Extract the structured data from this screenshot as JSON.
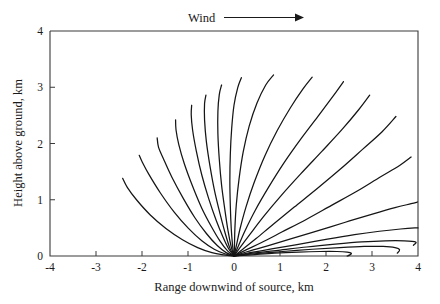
{
  "figure": {
    "background_color": "#ffffff",
    "curve_color": "#151515",
    "axis_color": "#3a3a3a"
  },
  "annotations": {
    "wind_label": "Wind",
    "wind_arrow_icon": "arrow-right-icon"
  },
  "axes": {
    "x_title": "Range downwind of source, km",
    "y_title": "Height above ground, km",
    "x_ticks": [
      "-4",
      "-3",
      "-2",
      "-1",
      "0",
      "1",
      "2",
      "3",
      "4"
    ],
    "y_ticks": [
      "0",
      "1",
      "2",
      "3",
      "4"
    ]
  },
  "chart_data": {
    "type": "line",
    "title": "",
    "xlabel": "Range downwind of source, km",
    "ylabel": "Height above ground, km",
    "xlim": [
      -4,
      4
    ],
    "ylim": [
      0,
      4
    ],
    "xticks": [
      -4,
      -3,
      -2,
      -1,
      0,
      1,
      2,
      3,
      4
    ],
    "yticks": [
      0,
      1,
      2,
      3,
      4
    ],
    "grid": false,
    "legend": null,
    "annotations": [
      {
        "text": "Wind",
        "position": "above-axes",
        "arrow": "points-right"
      }
    ],
    "series": [
      {
        "name": "trajectory-1",
        "x": [
          0,
          -0.22,
          -0.48,
          -0.79,
          -1.12,
          -1.48,
          -1.82,
          -2.12,
          -2.32,
          -2.42
        ],
        "y": [
          0,
          0.02,
          0.06,
          0.15,
          0.29,
          0.49,
          0.73,
          1.0,
          1.22,
          1.38
        ]
      },
      {
        "name": "trajectory-2",
        "x": [
          0,
          -0.2,
          -0.43,
          -0.7,
          -0.99,
          -1.3,
          -1.6,
          -1.85,
          -2.0,
          -2.06
        ],
        "y": [
          0,
          0.04,
          0.12,
          0.27,
          0.49,
          0.78,
          1.12,
          1.45,
          1.68,
          1.79
        ]
      },
      {
        "name": "trajectory-3",
        "x": [
          0,
          -0.17,
          -0.37,
          -0.6,
          -0.85,
          -1.1,
          -1.35,
          -1.53,
          -1.64,
          -1.67
        ],
        "y": [
          0,
          0.06,
          0.19,
          0.4,
          0.68,
          1.02,
          1.4,
          1.72,
          1.93,
          2.1
        ]
      },
      {
        "name": "trajectory-4",
        "x": [
          0,
          -0.14,
          -0.3,
          -0.49,
          -0.7,
          -0.9,
          -1.08,
          -1.2,
          -1.26,
          -1.27
        ],
        "y": [
          0,
          0.09,
          0.26,
          0.52,
          0.85,
          1.24,
          1.64,
          1.98,
          2.24,
          2.42
        ]
      },
      {
        "name": "trajectory-5",
        "x": [
          0,
          -0.11,
          -0.24,
          -0.39,
          -0.55,
          -0.7,
          -0.82,
          -0.9,
          -0.93,
          -0.92
        ],
        "y": [
          0,
          0.12,
          0.34,
          0.64,
          1.02,
          1.44,
          1.87,
          2.24,
          2.51,
          2.68
        ]
      },
      {
        "name": "trajectory-6",
        "x": [
          0,
          -0.09,
          -0.19,
          -0.3,
          -0.42,
          -0.52,
          -0.6,
          -0.64,
          -0.64,
          -0.61
        ],
        "y": [
          0,
          0.14,
          0.4,
          0.74,
          1.15,
          1.59,
          2.03,
          2.42,
          2.71,
          2.86
        ]
      },
      {
        "name": "trajectory-7",
        "x": [
          0,
          -0.06,
          -0.13,
          -0.2,
          -0.27,
          -0.32,
          -0.35,
          -0.35,
          -0.32,
          -0.27
        ],
        "y": [
          0,
          0.16,
          0.45,
          0.83,
          1.26,
          1.72,
          2.17,
          2.57,
          2.87,
          3.04
        ]
      },
      {
        "name": "trajectory-8",
        "x": [
          0,
          -0.03,
          -0.06,
          -0.08,
          -0.09,
          -0.08,
          -0.05,
          0.0,
          0.08,
          0.16
        ],
        "y": [
          0,
          0.18,
          0.49,
          0.89,
          1.34,
          1.81,
          2.27,
          2.68,
          2.99,
          3.17
        ]
      },
      {
        "name": "trajectory-9",
        "x": [
          0,
          0.01,
          0.02,
          0.05,
          0.11,
          0.2,
          0.33,
          0.5,
          0.69,
          0.86
        ],
        "y": [
          0,
          0.18,
          0.5,
          0.91,
          1.37,
          1.85,
          2.31,
          2.72,
          3.04,
          3.22
        ]
      },
      {
        "name": "trajectory-10",
        "x": [
          0,
          0.05,
          0.13,
          0.26,
          0.44,
          0.67,
          0.94,
          1.23,
          1.5,
          1.7
        ],
        "y": [
          0,
          0.18,
          0.48,
          0.87,
          1.31,
          1.78,
          2.23,
          2.64,
          2.97,
          3.18
        ]
      },
      {
        "name": "trajectory-11",
        "x": [
          0,
          0.09,
          0.24,
          0.46,
          0.75,
          1.09,
          1.47,
          1.85,
          2.17,
          2.38
        ],
        "y": [
          0,
          0.17,
          0.45,
          0.81,
          1.22,
          1.66,
          2.1,
          2.51,
          2.86,
          3.1
        ]
      },
      {
        "name": "trajectory-12",
        "x": [
          0,
          0.13,
          0.35,
          0.65,
          1.02,
          1.45,
          1.91,
          2.35,
          2.71,
          2.95
        ],
        "y": [
          0,
          0.15,
          0.39,
          0.71,
          1.07,
          1.46,
          1.86,
          2.25,
          2.6,
          2.86
        ]
      },
      {
        "name": "trajectory-13",
        "x": [
          0,
          0.19,
          0.48,
          0.86,
          1.31,
          1.81,
          2.32,
          2.8,
          3.22,
          3.52
        ],
        "y": [
          0,
          0.12,
          0.31,
          0.57,
          0.87,
          1.2,
          1.55,
          1.9,
          2.21,
          2.48
        ]
      },
      {
        "name": "trajectory-14",
        "x": [
          0,
          0.24,
          0.6,
          1.05,
          1.57,
          2.12,
          2.67,
          3.17,
          3.6,
          3.85
        ],
        "y": [
          0,
          0.1,
          0.24,
          0.43,
          0.65,
          0.9,
          1.15,
          1.4,
          1.61,
          1.76
        ]
      },
      {
        "name": "trajectory-15",
        "x": [
          0,
          0.3,
          0.73,
          1.25,
          1.83,
          2.42,
          2.99,
          3.5,
          3.85,
          3.99
        ],
        "y": [
          0,
          0.08,
          0.18,
          0.31,
          0.45,
          0.6,
          0.74,
          0.86,
          0.93,
          0.96
        ]
      },
      {
        "name": "trajectory-16",
        "x": [
          0,
          0.35,
          0.85,
          1.43,
          2.03,
          2.62,
          3.16,
          3.62,
          3.93,
          4.0
        ],
        "y": [
          0,
          0.06,
          0.13,
          0.21,
          0.3,
          0.38,
          0.44,
          0.48,
          0.5,
          0.5
        ]
      },
      {
        "name": "trajectory-17",
        "x": [
          0,
          0.4,
          0.96,
          1.58,
          2.2,
          2.78,
          3.29,
          3.7,
          3.95,
          3.9
        ],
        "y": [
          0,
          0.05,
          0.1,
          0.16,
          0.21,
          0.25,
          0.27,
          0.27,
          0.25,
          0.19
        ]
      },
      {
        "name": "trajectory-18",
        "x": [
          0,
          0.45,
          1.06,
          1.7,
          2.3,
          2.83,
          3.24,
          3.5,
          3.6,
          3.55
        ],
        "y": [
          0,
          0.04,
          0.08,
          0.12,
          0.15,
          0.17,
          0.17,
          0.15,
          0.11,
          0.05
        ]
      },
      {
        "name": "trajectory-19",
        "x": [
          0,
          0.38,
          0.88,
          1.4,
          1.87,
          2.24,
          2.46,
          2.55,
          2.52,
          2.46
        ],
        "y": [
          0,
          0.02,
          0.05,
          0.07,
          0.08,
          0.08,
          0.07,
          0.05,
          0.02,
          0.0
        ]
      }
    ]
  }
}
